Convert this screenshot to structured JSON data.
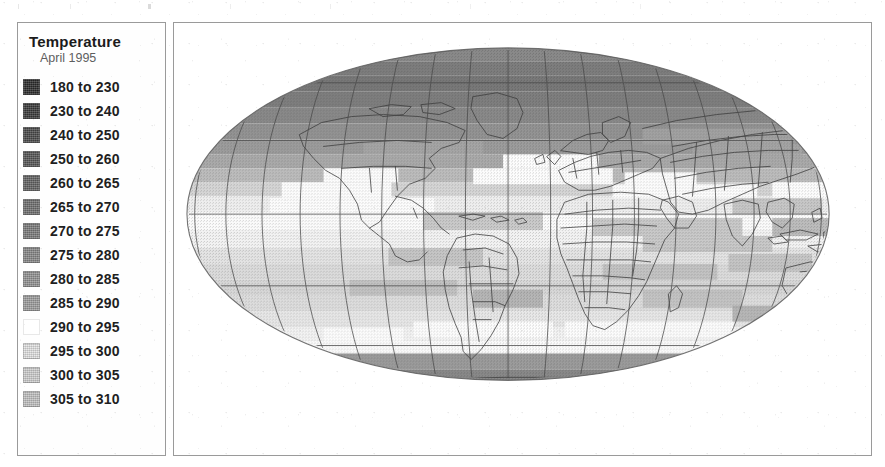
{
  "figure": {
    "kind": "world-temperature-map",
    "projection": "Mollweide"
  },
  "legend": {
    "title": "Temperature",
    "subtitle": "April 1995",
    "units_implied": "Kelvin",
    "border_color": "#9a9a9a",
    "items": [
      {
        "label": "180 to 230",
        "from": 180,
        "to": 230,
        "color": "#2b2b2b"
      },
      {
        "label": "230 to 240",
        "from": 230,
        "to": 240,
        "color": "#3a3a3a"
      },
      {
        "label": "240 to 250",
        "from": 240,
        "to": 250,
        "color": "#4a4a4a"
      },
      {
        "label": "250 to 260",
        "from": 250,
        "to": 260,
        "color": "#565656"
      },
      {
        "label": "260 to 265",
        "from": 260,
        "to": 265,
        "color": "#636363"
      },
      {
        "label": "265 to 270",
        "from": 265,
        "to": 270,
        "color": "#6f6f6f"
      },
      {
        "label": "270 to 275",
        "from": 270,
        "to": 275,
        "color": "#7c7c7c"
      },
      {
        "label": "275 to 280",
        "from": 275,
        "to": 280,
        "color": "#888888"
      },
      {
        "label": "280 to 285",
        "from": 280,
        "to": 285,
        "color": "#939393"
      },
      {
        "label": "285 to 290",
        "from": 285,
        "to": 290,
        "color": "#9e9e9e"
      },
      {
        "label": "290 to 295",
        "from": 290,
        "to": 295,
        "color": "#ffffff"
      },
      {
        "label": "295 to 300",
        "from": 295,
        "to": 300,
        "color": "#e3e3e3"
      },
      {
        "label": "300 to 305",
        "from": 300,
        "to": 305,
        "color": "#cfcfcf"
      },
      {
        "label": "305 to 310",
        "from": 305,
        "to": 310,
        "color": "#c2c2c2"
      }
    ]
  },
  "chart_data": {
    "type": "heatmap",
    "title": "Temperature",
    "subtitle": "April 1995",
    "projection": "Mollweide",
    "xlabel": "Longitude",
    "ylabel": "Latitude",
    "xlim": [
      -180,
      180
    ],
    "ylim": [
      -90,
      90
    ],
    "grid": true,
    "legend_position": "left-panel",
    "colorbar_orientation": "vertical-discrete",
    "value_unit": "K",
    "bin_edges": [
      180,
      230,
      240,
      250,
      260,
      265,
      270,
      275,
      280,
      285,
      290,
      295,
      300,
      305,
      310
    ],
    "bin_labels": [
      "180 to 230",
      "230 to 240",
      "240 to 250",
      "250 to 260",
      "260 to 265",
      "265 to 270",
      "270 to 275",
      "275 to 280",
      "280 to 285",
      "285 to 290",
      "290 to 295",
      "295 to 300",
      "300 to 305",
      "305 to 310"
    ],
    "bin_colors": [
      "#2b2b2b",
      "#3a3a3a",
      "#4a4a4a",
      "#565656",
      "#636363",
      "#6f6f6f",
      "#7c7c7c",
      "#888888",
      "#939393",
      "#9e9e9e",
      "#ffffff",
      "#e3e3e3",
      "#cfcfcf",
      "#c2c2c2"
    ],
    "graticule": {
      "meridian_step_deg": 20,
      "parallel_step_deg": 30,
      "parallels": [
        -60,
        -30,
        0,
        30,
        60
      ]
    },
    "zonal_mean_by_latitude_band": [
      {
        "lat_center": 85,
        "value": 255
      },
      {
        "lat_center": 75,
        "value": 258
      },
      {
        "lat_center": 65,
        "value": 265
      },
      {
        "lat_center": 55,
        "value": 272
      },
      {
        "lat_center": 45,
        "value": 281
      },
      {
        "lat_center": 35,
        "value": 289
      },
      {
        "lat_center": 25,
        "value": 295
      },
      {
        "lat_center": 15,
        "value": 299
      },
      {
        "lat_center": 5,
        "value": 301
      },
      {
        "lat_center": -5,
        "value": 300
      },
      {
        "lat_center": -15,
        "value": 297
      },
      {
        "lat_center": -25,
        "value": 292
      },
      {
        "lat_center": -35,
        "value": 286
      },
      {
        "lat_center": -45,
        "value": 280
      },
      {
        "lat_center": -55,
        "value": 273
      },
      {
        "lat_center": -65,
        "value": 258
      },
      {
        "lat_center": -75,
        "value": 240
      },
      {
        "lat_center": -85,
        "value": 225
      }
    ]
  }
}
